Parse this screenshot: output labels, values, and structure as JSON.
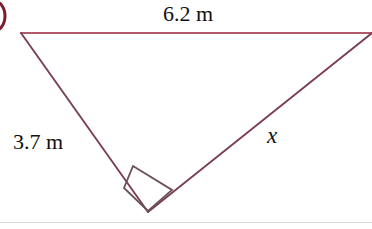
{
  "figure": {
    "kind": "right-triangle-diagram",
    "canvas": {
      "width": 372,
      "height": 229
    },
    "background_color": "#ffffff",
    "colors": {
      "top_side_stroke": "#b05a6a",
      "leg_stroke": "#7a4050",
      "right_angle_stroke": "#6b5058",
      "item_marker_stroke": "#7a1f2e",
      "baseline_rule": "#dcdcdc",
      "text": "#101010"
    },
    "vertices": {
      "top_left": {
        "x": 21,
        "y": 33
      },
      "top_right": {
        "x": 372,
        "y": 33
      },
      "bottom": {
        "x": 148,
        "y": 212
      }
    },
    "sides": [
      {
        "name": "top-side",
        "label": "6.2 m",
        "from": "top_left",
        "to": "top_right",
        "stroke": "#b05a6a"
      },
      {
        "name": "left-leg",
        "label": "3.7 m",
        "from": "top_left",
        "to": "bottom",
        "stroke": "#7a4050"
      },
      {
        "name": "right-leg-unknown",
        "label": "x",
        "from": "bottom",
        "to": "top_right",
        "stroke": "#7a4050"
      }
    ],
    "right_angle_marker": {
      "at_vertex": "bottom",
      "points": "133,166 172,190 148,211 124,188",
      "stroke": "#6b5058"
    },
    "item_marker": {
      "description": "partial circled question-number label cut off at left edge",
      "cx": -6,
      "cy": 16,
      "rx": 11,
      "ry": 15
    },
    "baseline_rule": {
      "y": 222,
      "x1": 0,
      "x2": 372
    }
  },
  "labels": {
    "top_side": "6.2 m",
    "left_leg": "3.7 m",
    "hypotenuse": "x"
  }
}
